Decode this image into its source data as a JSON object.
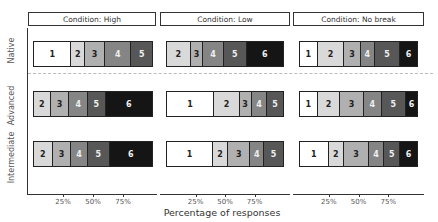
{
  "chart_data": {
    "type": "bar",
    "orientation": "horizontal-stacked-100",
    "title": "",
    "xlabel": "Percentage of responses",
    "ylabel": "",
    "x_ticks": [
      "25%",
      "50%",
      "75%"
    ],
    "xlim": [
      0,
      100
    ],
    "facets": [
      "Condition: High",
      "Condition: Low",
      "Condition: No break"
    ],
    "rows": [
      "Native",
      "Advanced",
      "Intermediate"
    ],
    "categories_legend": [
      "1",
      "2",
      "3",
      "4",
      "5",
      "6"
    ],
    "colors": {
      "1": "#ffffff",
      "2": "#d9d9d9",
      "3": "#b0b0b0",
      "4": "#858585",
      "5": "#575757",
      "6": "#151515"
    },
    "text_colors": {
      "1": "#222222",
      "2": "#222222",
      "3": "#222222",
      "4": "#eeeeee",
      "5": "#eeeeee",
      "6": "#eeeeee"
    },
    "panels": [
      {
        "facet": "Condition: High",
        "rows": [
          {
            "group": "Native",
            "segments": [
              {
                "level": "1",
                "pct": 31.7
              },
              {
                "level": "2",
                "pct": 11.7
              },
              {
                "level": "3",
                "pct": 16.7
              },
              {
                "level": "4",
                "pct": 22.5
              },
              {
                "level": "5",
                "pct": 17.4
              }
            ]
          },
          {
            "group": "Advanced",
            "segments": [
              {
                "level": "2",
                "pct": 14.2
              },
              {
                "level": "3",
                "pct": 15.8
              },
              {
                "level": "4",
                "pct": 15.8
              },
              {
                "level": "5",
                "pct": 15.0
              },
              {
                "level": "6",
                "pct": 39.2
              }
            ]
          },
          {
            "group": "Intermediate",
            "segments": [
              {
                "level": "2",
                "pct": 15.8
              },
              {
                "level": "3",
                "pct": 15.8
              },
              {
                "level": "4",
                "pct": 14.2
              },
              {
                "level": "5",
                "pct": 18.3
              },
              {
                "level": "6",
                "pct": 35.9
              }
            ]
          }
        ]
      },
      {
        "facet": "Condition: Low",
        "rows": [
          {
            "group": "Native",
            "segments": [
              {
                "level": "2",
                "pct": 20.3
              },
              {
                "level": "3",
                "pct": 11.0
              },
              {
                "level": "4",
                "pct": 17.8
              },
              {
                "level": "5",
                "pct": 19.5
              },
              {
                "level": "6",
                "pct": 31.4
              }
            ]
          },
          {
            "group": "Advanced",
            "segments": [
              {
                "level": "1",
                "pct": 40.7
              },
              {
                "level": "2",
                "pct": 22.0
              },
              {
                "level": "3",
                "pct": 10.2
              },
              {
                "level": "4",
                "pct": 13.6
              },
              {
                "level": "5",
                "pct": 13.5
              }
            ]
          },
          {
            "group": "Intermediate",
            "segments": [
              {
                "level": "1",
                "pct": 39.8
              },
              {
                "level": "2",
                "pct": 12.7
              },
              {
                "level": "3",
                "pct": 19.5
              },
              {
                "level": "4",
                "pct": 11.9
              },
              {
                "level": "5",
                "pct": 16.1
              }
            ]
          }
        ]
      },
      {
        "facet": "Condition: No break",
        "rows": [
          {
            "group": "Native",
            "segments": [
              {
                "level": "1",
                "pct": 15.1
              },
              {
                "level": "2",
                "pct": 22.7
              },
              {
                "level": "3",
                "pct": 14.3
              },
              {
                "level": "4",
                "pct": 11.8
              },
              {
                "level": "5",
                "pct": 21.8
              },
              {
                "level": "6",
                "pct": 14.3
              }
            ]
          },
          {
            "group": "Advanced",
            "segments": [
              {
                "level": "1",
                "pct": 15.1
              },
              {
                "level": "2",
                "pct": 19.3
              },
              {
                "level": "3",
                "pct": 20.2
              },
              {
                "level": "4",
                "pct": 15.1
              },
              {
                "level": "5",
                "pct": 21.0
              },
              {
                "level": "6",
                "pct": 9.3
              }
            ]
          },
          {
            "group": "Intermediate",
            "segments": [
              {
                "level": "1",
                "pct": 24.4
              },
              {
                "level": "2",
                "pct": 13.4
              },
              {
                "level": "3",
                "pct": 21.0
              },
              {
                "level": "4",
                "pct": 13.4
              },
              {
                "level": "5",
                "pct": 13.5
              },
              {
                "level": "6",
                "pct": 14.3
              }
            ]
          }
        ]
      }
    ],
    "grid": false,
    "legend": "none (segment labels inside bars)"
  }
}
